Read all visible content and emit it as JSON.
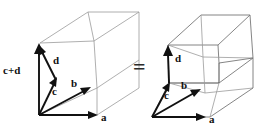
{
  "figure": {
    "background_color": "#ffffff",
    "relation_symbol": "=",
    "left_figure": {
      "name": "box-with-c-plus-d",
      "vector_labels": {
        "a": "a",
        "b": "b",
        "c": "c",
        "d": "d",
        "c_plus_d": "c+d"
      }
    },
    "right_figure": {
      "name": "sheared-box-pair",
      "vector_labels": {
        "a": "a",
        "b": "b",
        "c": "c",
        "d": "d"
      }
    },
    "colors": {
      "vector_stroke": "#111111",
      "edge_light": "#9b9b9b",
      "edge_mid": "#777777",
      "edge_dark": "#4a4a4a",
      "text": "#111111"
    }
  }
}
